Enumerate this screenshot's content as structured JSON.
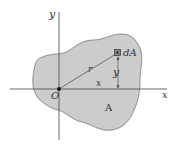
{
  "diagram": {
    "title": "",
    "colors": {
      "area_fill": "#cccccc",
      "area_stroke": "#777777",
      "axis": "#555555",
      "line": "#555555",
      "text": "#333333"
    },
    "labels": {
      "x_axis": "x",
      "y_axis": "y",
      "origin": "O",
      "element": "dA",
      "radius": "r",
      "x_distance": "x",
      "y_distance": "y",
      "area": "A"
    }
  }
}
